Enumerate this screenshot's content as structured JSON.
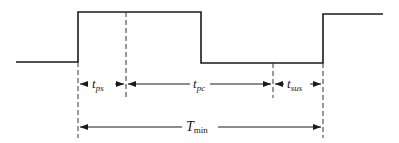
{
  "diagram": {
    "type": "timing-diagram",
    "waveform": {
      "points": [
        [
          16,
          62
        ],
        [
          78,
          62
        ],
        [
          78,
          12
        ],
        [
          201,
          12
        ],
        [
          201,
          63
        ],
        [
          323,
          63
        ],
        [
          323,
          14
        ],
        [
          383,
          14
        ]
      ],
      "color": "#1a1a1a"
    },
    "markers_x": [
      78,
      126,
      273,
      323
    ],
    "intervals": [
      {
        "id": "t_ps",
        "main": "t",
        "sub": "ps",
        "x1": 78,
        "x2": 126,
        "y": 84
      },
      {
        "id": "t_pc",
        "main": "t",
        "sub": "pc",
        "x1": 126,
        "x2": 273,
        "y": 84
      },
      {
        "id": "t_sus",
        "main": "t",
        "sub": "sus",
        "x1": 273,
        "x2": 323,
        "y": 84
      }
    ],
    "total": {
      "id": "T_min",
      "main": "T",
      "sub": "min",
      "x1": 78,
      "x2": 323,
      "y": 127
    }
  },
  "labels": {
    "t_ps_main": "t",
    "t_ps_sub": "ps",
    "t_pc_main": "t",
    "t_pc_sub": "pc",
    "t_sus_main": "t",
    "t_sus_sub": "sus",
    "T_min_main": "T",
    "T_min_sub": "min"
  }
}
